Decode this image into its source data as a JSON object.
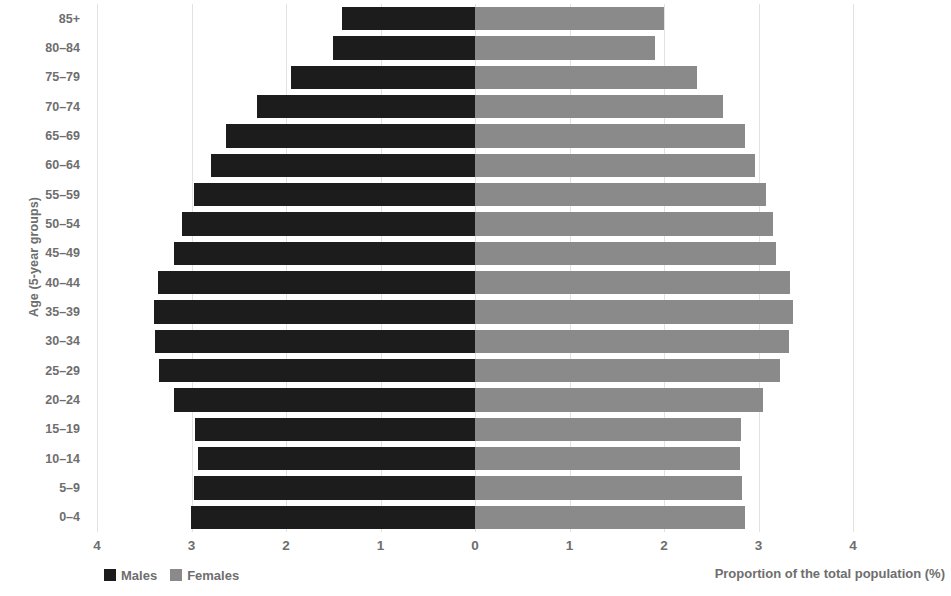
{
  "chart_data": {
    "type": "bar",
    "subtype": "population-pyramid",
    "title": "",
    "xlabel": "Proportion of the total population (%)",
    "ylabel": "Age (5-year groups)",
    "categories": [
      "0–4",
      "5–9",
      "10–14",
      "15–19",
      "20–24",
      "25–29",
      "30–34",
      "35–39",
      "40–44",
      "45–49",
      "50–54",
      "55–59",
      "60–64",
      "65–69",
      "70–74",
      "75–79",
      "80–84",
      "85+"
    ],
    "series": [
      {
        "name": "Males",
        "color": "#1c1c1c",
        "values": [
          3.01,
          2.97,
          2.93,
          2.96,
          3.18,
          3.34,
          3.39,
          3.4,
          3.35,
          3.19,
          3.1,
          2.97,
          2.79,
          2.63,
          2.31,
          1.95,
          1.5,
          1.41
        ]
      },
      {
        "name": "Females",
        "color": "#8a8a8a",
        "values": [
          2.86,
          2.83,
          2.8,
          2.82,
          3.05,
          3.23,
          3.32,
          3.36,
          3.33,
          3.19,
          3.15,
          3.08,
          2.96,
          2.86,
          2.62,
          2.35,
          1.9,
          2.0
        ]
      }
    ],
    "axis": {
      "x_ticks": [
        "4",
        "3",
        "2",
        "1",
        "0",
        "1",
        "2",
        "3",
        "4"
      ],
      "x_tick_values": [
        -4,
        -3,
        -2,
        -1,
        0,
        1,
        2,
        3,
        4
      ],
      "xlim": [
        -4,
        4
      ],
      "grid": true,
      "grid_axis": "x"
    },
    "legend": {
      "position": "bottom-left",
      "entries": [
        {
          "label": "Males",
          "color": "#1c1c1c",
          "swatch": "square-swatch"
        },
        {
          "label": "Females",
          "color": "#8a8a8a",
          "swatch": "square-swatch"
        }
      ]
    }
  }
}
